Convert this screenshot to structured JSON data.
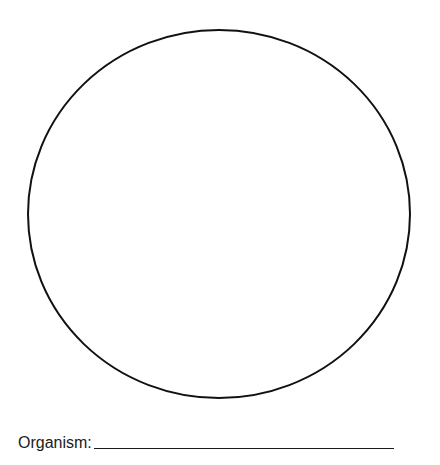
{
  "worksheet": {
    "field_label": "Organism:",
    "field_value": "",
    "circle": {
      "cx": 219,
      "cy": 214,
      "rx": 191,
      "ry": 184,
      "stroke": "#111111"
    }
  }
}
